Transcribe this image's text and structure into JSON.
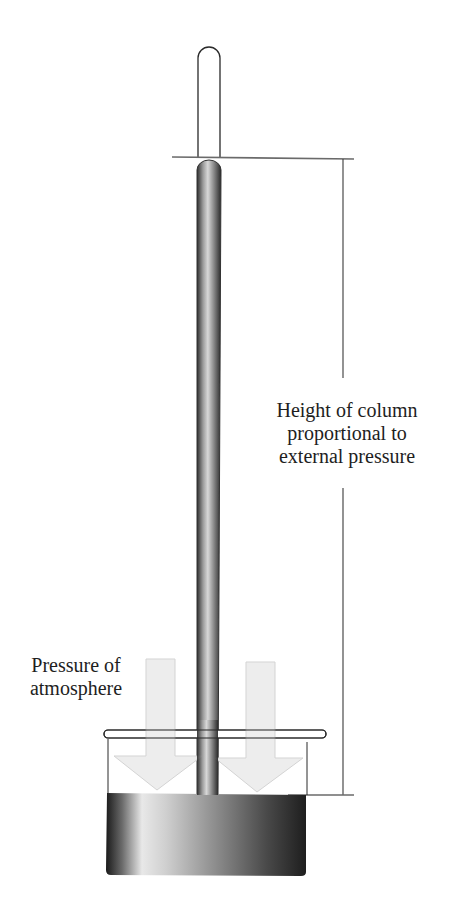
{
  "diagram": {
    "type": "barometer",
    "labels": {
      "height_line1": "Height of column",
      "height_line2": "proportional to",
      "height_line3": "external pressure",
      "pressure_line1": "Pressure of",
      "pressure_line2": "atmosphere"
    },
    "colors": {
      "outline": "#2a2a2a",
      "arrow_fill": "#ececec",
      "arrow_stroke": "#cfcfcf",
      "mercury_dark": "#3a3a3a",
      "mercury_light": "#e6e6e6"
    }
  }
}
